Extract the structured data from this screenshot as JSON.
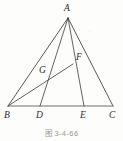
{
  "figure": {
    "caption": "图 3-4-66",
    "stroke_color": "#3a3a3a",
    "base_stroke_color": "#6e6e6e",
    "label_color": "#2b2b2b",
    "background_color": "#fdfdfc",
    "width": 123,
    "height": 141
  },
  "points": [
    {
      "name": "A",
      "label": "A",
      "x": 68,
      "y": 18,
      "label_x": 64,
      "label_y": 4
    },
    {
      "name": "B",
      "label": "B",
      "x": 8,
      "y": 106,
      "label_x": 4,
      "label_y": 111
    },
    {
      "name": "C",
      "label": "C",
      "x": 113,
      "y": 106,
      "label_x": 109,
      "label_y": 111
    },
    {
      "name": "D",
      "label": "D",
      "x": 40,
      "y": 106,
      "label_x": 36,
      "label_y": 111
    },
    {
      "name": "E",
      "label": "E",
      "x": 84,
      "y": 106,
      "label_x": 80,
      "label_y": 111
    },
    {
      "name": "F",
      "label": "F",
      "x": 73,
      "y": 64,
      "label_x": 76,
      "label_y": 53
    },
    {
      "name": "G",
      "label": "G",
      "x": 49,
      "y": 78,
      "label_x": 39,
      "label_y": 66
    }
  ],
  "segments": [
    {
      "name": "side-AB",
      "from": "A",
      "to": "B",
      "kind": "side"
    },
    {
      "name": "side-AC",
      "from": "A",
      "to": "C",
      "kind": "side"
    },
    {
      "name": "base-BC",
      "from": "B",
      "to": "C",
      "kind": "base"
    },
    {
      "name": "cevian-AD",
      "from": "A",
      "to": "D",
      "kind": "cevian"
    },
    {
      "name": "cevian-AE",
      "from": "A",
      "to": "E",
      "kind": "cevian"
    },
    {
      "name": "cevian-BF",
      "from": "B",
      "to": "F",
      "kind": "cevian"
    }
  ]
}
